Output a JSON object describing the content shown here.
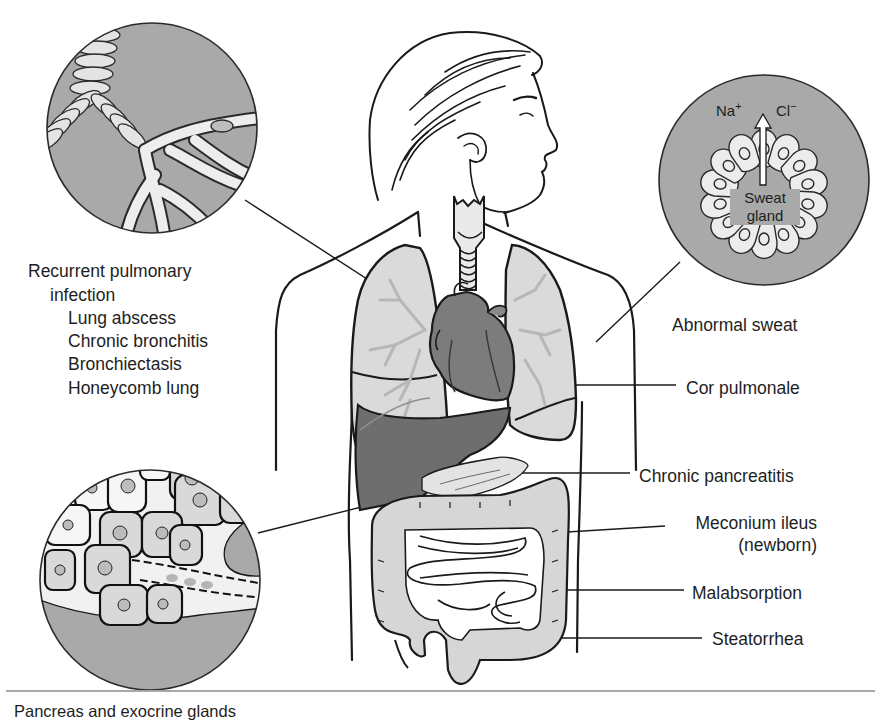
{
  "figure": {
    "colors": {
      "inset_fill": "#a9a9a9",
      "organ_light": "#d9d9d9",
      "organ_dark": "#6e6e6e",
      "line": "#1a1a1a",
      "cell_fill": "#ededed",
      "rule": "#a8a8a8"
    }
  },
  "insets": {
    "lung": {
      "name": "Bronchial tree inset"
    },
    "sweat_gland": {
      "ion_left": "Na",
      "ion_left_charge": "+",
      "ion_right": "Cl",
      "ion_right_charge": "−",
      "label_line1": "Sweat",
      "label_line2": "gland"
    },
    "pancreas": {
      "caption": "Pancreas and exocrine glands"
    }
  },
  "labels_left": {
    "heading_line1": "Recurrent pulmonary",
    "heading_line2": "infection",
    "items": [
      "Lung abscess",
      "Chronic bronchitis",
      "Bronchiectasis",
      "Honeycomb lung"
    ]
  },
  "labels_right": [
    {
      "id": "sweat",
      "text": "Abnormal sweat"
    },
    {
      "id": "cor",
      "text": "Cor pulmonale"
    },
    {
      "id": "pancreatitis",
      "text": "Chronic pancreatitis"
    },
    {
      "id": "meconium",
      "text": "Meconium ileus",
      "text2": "(newborn)"
    },
    {
      "id": "malabsorption",
      "text": "Malabsorption"
    },
    {
      "id": "steatorrhea",
      "text": "Steatorrhea"
    }
  ]
}
